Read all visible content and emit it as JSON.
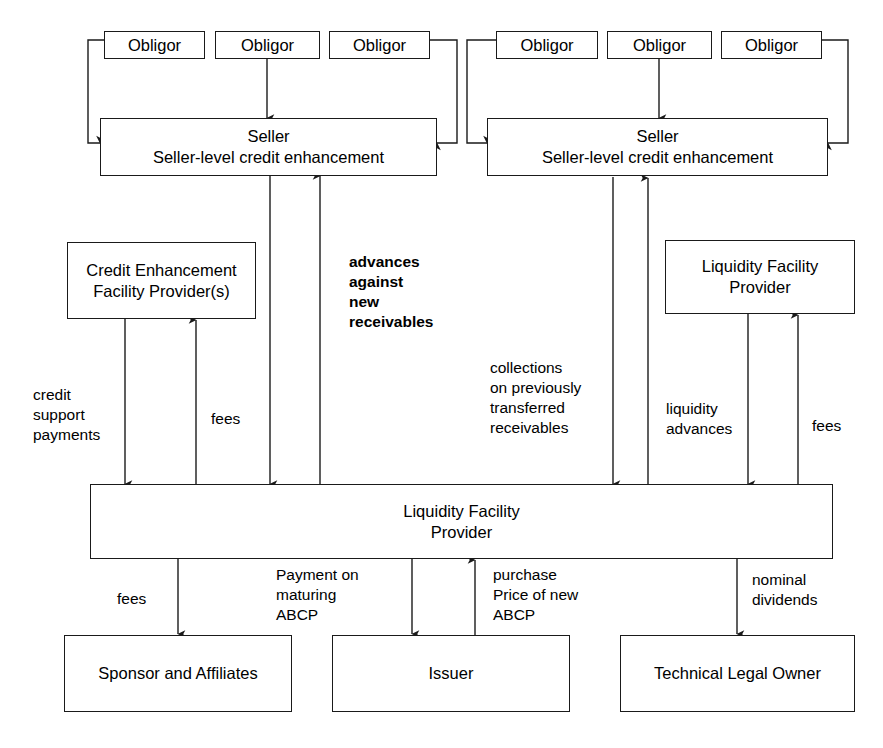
{
  "diagram": {
    "stroke_color": "#1a1a1a",
    "background_color": "#ffffff",
    "nodes": {
      "obligor_l1": {
        "label": "Obligor"
      },
      "obligor_l2": {
        "label": "Obligor"
      },
      "obligor_l3": {
        "label": "Obligor"
      },
      "obligor_r1": {
        "label": "Obligor"
      },
      "obligor_r2": {
        "label": "Obligor"
      },
      "obligor_r3": {
        "label": "Obligor"
      },
      "seller_left": {
        "line1": "Seller",
        "line2": "Seller-level credit enhancement"
      },
      "seller_right": {
        "line1": "Seller",
        "line2": "Seller-level credit enhancement"
      },
      "credit_enhancement": {
        "line1": "Credit Enhancement",
        "line2": "Facility Provider(s)"
      },
      "liquidity_provider_right": {
        "line1": "Liquidity Facility",
        "line2": "Provider"
      },
      "conduit": {
        "line1": "Liquidity Facility",
        "line2": "Provider"
      },
      "sponsor": {
        "label": "Sponsor and Affiliates"
      },
      "issuer": {
        "label": "Issuer"
      },
      "technical_legal_owner": {
        "label": "Technical Legal Owner"
      }
    },
    "edge_labels": {
      "advances_against_new_receivables": {
        "line1": "advances",
        "line2": "against",
        "line3": "new",
        "line4": "receivables"
      },
      "credit_support_payments": {
        "line1": "credit",
        "line2": "support",
        "line3": "payments"
      },
      "fees_credit_enhancement": {
        "line1": "fees"
      },
      "collections_previously_transferred": {
        "line1": "collections",
        "line2": "on previously",
        "line3": "transferred",
        "line4": "receivables"
      },
      "liquidity_advances": {
        "line1": "liquidity",
        "line2": "advances"
      },
      "fees_liquidity": {
        "line1": "fees"
      },
      "fees_sponsor": {
        "line1": "fees"
      },
      "payment_on_maturing_abcp": {
        "line1": "Payment on",
        "line2": "maturing",
        "line3": "ABCP"
      },
      "purchase_price_of_new_abcp": {
        "line1": "purchase",
        "line2": "Price of new",
        "line3": "ABCP"
      },
      "nominal_dividends": {
        "line1": "nominal",
        "line2": "dividends"
      }
    }
  }
}
